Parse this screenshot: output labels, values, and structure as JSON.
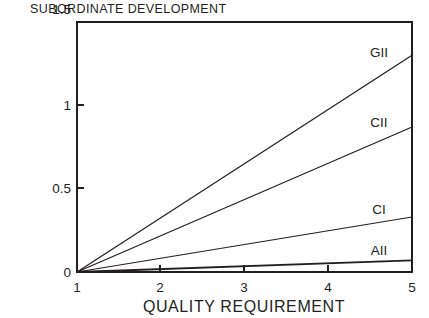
{
  "chart_data": {
    "type": "line",
    "title": "SUBORDINATE DEVELOPMENT",
    "xlabel": "QUALITY REQUIREMENT",
    "ylabel": "",
    "xlim": [
      1,
      5
    ],
    "ylim": [
      0,
      1.5
    ],
    "xticks": [
      "1",
      "2",
      "3",
      "4",
      "5"
    ],
    "xtick_values": [
      1,
      2,
      3,
      4,
      5
    ],
    "yticks": [
      "0",
      "0.5",
      "1",
      "1.5"
    ],
    "ytick_values": [
      0,
      0.5,
      1,
      1.5
    ],
    "grid": false,
    "legend": "inline-right-labels",
    "x": [
      1,
      5
    ],
    "series": [
      {
        "name": "GII",
        "values": [
          0,
          1.3
        ],
        "label": "GII"
      },
      {
        "name": "CII",
        "values": [
          0,
          0.87
        ],
        "label": "CII"
      },
      {
        "name": "CI",
        "values": [
          0,
          0.33
        ],
        "label": "CI"
      },
      {
        "name": "AII",
        "values": [
          0,
          0.07
        ],
        "label": "AII"
      }
    ]
  },
  "labels": {
    "title": "SUBORDINATE DEVELOPMENT",
    "xlabel": "QUALITY REQUIREMENT",
    "y_1_5": "1.5",
    "y_1": "1",
    "y_0_5": "0.5",
    "y_0": "0",
    "x_1": "1",
    "x_2": "2",
    "x_3": "3",
    "x_4": "4",
    "x_5": "5",
    "series_gii": "GII",
    "series_cii": "CII",
    "series_ci": "CI",
    "series_aii": "AII"
  },
  "colors": {
    "ink": "#231f20",
    "background": "#ffffff"
  }
}
